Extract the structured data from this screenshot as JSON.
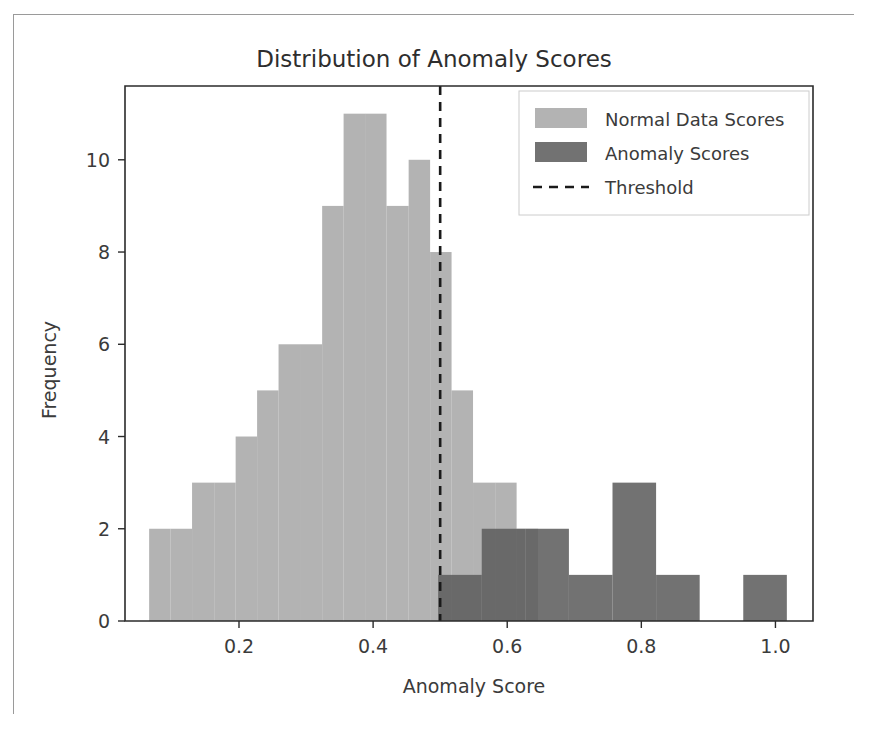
{
  "figure": {
    "title": "Distribution of Anomaly Scores",
    "xlabel": "Anomaly Score",
    "ylabel": "Frequency",
    "background": "#ffffff",
    "frame_color": "#9a9a9a"
  },
  "legend": {
    "position": "upper-right",
    "entries": [
      {
        "label": "Normal Data Scores",
        "marker": "patch",
        "color": "#a9a9a9"
      },
      {
        "label": "Anomaly Scores",
        "marker": "patch",
        "color": "#5e5e5e"
      },
      {
        "label": "Threshold",
        "marker": "dashed-line",
        "color": "#1a1a1a"
      }
    ]
  },
  "chart_data": {
    "type": "bar",
    "title": "Distribution of Anomaly Scores",
    "xlabel": "Anomaly Score",
    "ylabel": "Frequency",
    "grid": false,
    "legend_position": "upper right",
    "xlim": [
      0.03,
      1.056
    ],
    "ylim": [
      0,
      11.6
    ],
    "xticks": [
      0.2,
      0.4,
      0.6,
      0.8,
      1.0
    ],
    "xticklabels": [
      "0.2",
      "0.4",
      "0.6",
      "0.8",
      "1.0"
    ],
    "yticks": [
      0,
      2,
      4,
      6,
      8,
      10
    ],
    "yticklabels": [
      "0",
      "2",
      "4",
      "6",
      "8",
      "10"
    ],
    "annotations": [
      {
        "kind": "vline",
        "label": "Threshold",
        "x": 0.5,
        "style": "dashed",
        "color": "#1a1a1a"
      }
    ],
    "series": [
      {
        "name": "Normal Data Scores",
        "color": "#a9a9a9",
        "bin_width": 0.0322,
        "bins": [
          {
            "x0": 0.066,
            "x1": 0.098,
            "value": 2
          },
          {
            "x0": 0.098,
            "x1": 0.13,
            "value": 2
          },
          {
            "x0": 0.13,
            "x1": 0.163,
            "value": 3
          },
          {
            "x0": 0.163,
            "x1": 0.195,
            "value": 3
          },
          {
            "x0": 0.195,
            "x1": 0.227,
            "value": 4
          },
          {
            "x0": 0.227,
            "x1": 0.259,
            "value": 5
          },
          {
            "x0": 0.259,
            "x1": 0.291,
            "value": 6
          },
          {
            "x0": 0.291,
            "x1": 0.324,
            "value": 6
          },
          {
            "x0": 0.324,
            "x1": 0.356,
            "value": 9
          },
          {
            "x0": 0.356,
            "x1": 0.388,
            "value": 11
          },
          {
            "x0": 0.388,
            "x1": 0.42,
            "value": 11
          },
          {
            "x0": 0.42,
            "x1": 0.453,
            "value": 9
          },
          {
            "x0": 0.453,
            "x1": 0.485,
            "value": 10
          },
          {
            "x0": 0.485,
            "x1": 0.517,
            "value": 8
          },
          {
            "x0": 0.517,
            "x1": 0.549,
            "value": 5
          },
          {
            "x0": 0.549,
            "x1": 0.582,
            "value": 3
          },
          {
            "x0": 0.582,
            "x1": 0.614,
            "value": 3
          },
          {
            "x0": 0.614,
            "x1": 0.646,
            "value": 2
          }
        ]
      },
      {
        "name": "Anomaly Scores",
        "color": "#5e5e5e",
        "bin_width": 0.065,
        "bins": [
          {
            "x0": 0.497,
            "x1": 0.562,
            "value": 1
          },
          {
            "x0": 0.562,
            "x1": 0.627,
            "value": 2
          },
          {
            "x0": 0.627,
            "x1": 0.692,
            "value": 2
          },
          {
            "x0": 0.692,
            "x1": 0.757,
            "value": 1
          },
          {
            "x0": 0.757,
            "x1": 0.822,
            "value": 3
          },
          {
            "x0": 0.822,
            "x1": 0.887,
            "value": 1
          },
          {
            "x0": 0.887,
            "x1": 0.952,
            "value": 0
          },
          {
            "x0": 0.952,
            "x1": 1.017,
            "value": 1
          }
        ]
      }
    ]
  }
}
